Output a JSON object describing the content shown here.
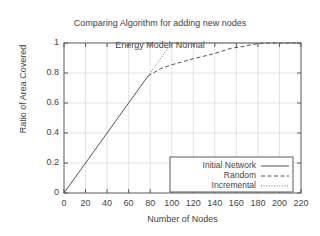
{
  "chart_data": {
    "type": "line",
    "title": "Comparing Algorithm for adding new nodes\nEnergy Model: Normal",
    "title_line1": "Comparing Algorithm for adding new nodes",
    "title_line2": "Energy Model: Normal",
    "xlabel": "Number of Nodes",
    "ylabel": "Ratio of Area Covered",
    "xlim": [
      0,
      220
    ],
    "ylim": [
      0,
      1
    ],
    "xticks": [
      0,
      20,
      40,
      60,
      80,
      100,
      120,
      140,
      160,
      180,
      200,
      220
    ],
    "xtick_labels": [
      "0",
      "20",
      "40",
      "60",
      "80",
      "100",
      "120",
      "140",
      "160",
      "180",
      "200",
      "220"
    ],
    "yticks": [
      0,
      0.2,
      0.4,
      0.6,
      0.8,
      1
    ],
    "ytick_labels": [
      "0",
      "0.2",
      "0.4",
      "0.6",
      "0.8",
      "1"
    ],
    "grid": true,
    "legend_position": "lower right",
    "series": [
      {
        "name": "Initial Network",
        "style": "solid",
        "color": "#555555",
        "points": [
          [
            0,
            0
          ],
          [
            78,
            0.78
          ]
        ]
      },
      {
        "name": "Random",
        "style": "dashed",
        "color": "#555555",
        "points": [
          [
            78,
            0.78
          ],
          [
            90,
            0.83
          ],
          [
            100,
            0.855
          ],
          [
            120,
            0.895
          ],
          [
            140,
            0.93
          ],
          [
            155,
            0.965
          ],
          [
            165,
            0.975
          ],
          [
            175,
            0.99
          ],
          [
            185,
            1.0
          ],
          [
            220,
            1.0
          ]
        ]
      },
      {
        "name": "Incremental",
        "style": "dotted",
        "color": "#777777",
        "points": [
          [
            78,
            0.78
          ],
          [
            100,
            1.0
          ],
          [
            220,
            1.0
          ]
        ]
      }
    ]
  },
  "legend": {
    "items": [
      {
        "label": "Initial Network",
        "style": "solid"
      },
      {
        "label": "Random",
        "style": "dashed"
      },
      {
        "label": "Incremental",
        "style": "dotted"
      }
    ]
  }
}
